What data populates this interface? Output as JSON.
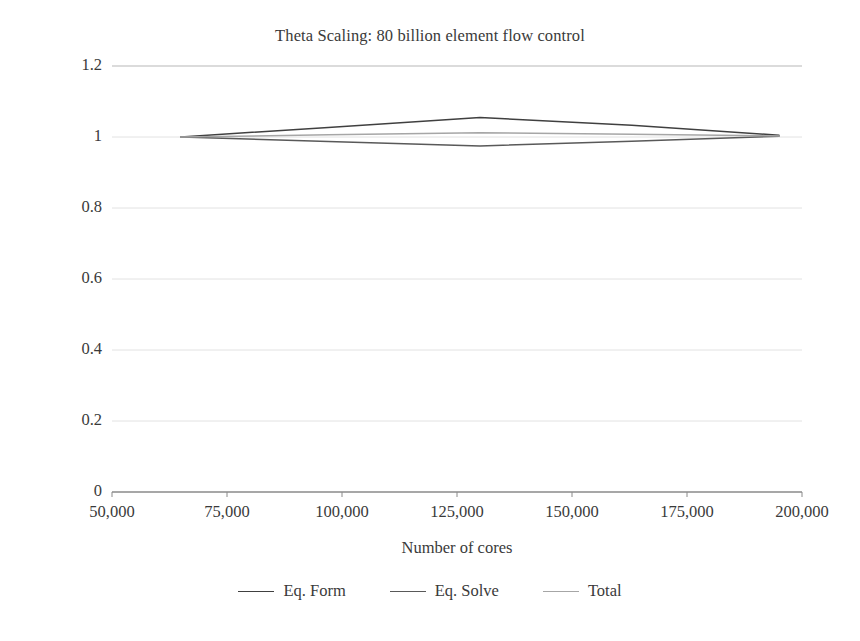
{
  "chart_data": {
    "type": "line",
    "title": "Theta Scaling: 80 billion element flow control",
    "xlabel": "Number of cores",
    "ylabel": "Scaling (core-hour ratio)",
    "xlim": [
      50000,
      200000
    ],
    "ylim": [
      0,
      1.2
    ],
    "xticks": [
      50000,
      75000,
      100000,
      125000,
      150000,
      175000,
      200000
    ],
    "xticklabels": [
      "50,000",
      "75,000",
      "100,000",
      "125,000",
      "150,000",
      "175,000",
      "200,000"
    ],
    "yticks": [
      0,
      0.2,
      0.4,
      0.6,
      0.8,
      1,
      1.2
    ],
    "yticklabels": [
      "0",
      "0.2",
      "0.4",
      "0.6",
      "0.8",
      "1",
      "1.2"
    ],
    "grid": "horizontal",
    "legend_position": "bottom",
    "x": [
      65000,
      97000,
      130000,
      163000,
      195000
    ],
    "series": [
      {
        "name": "Eq. Form",
        "color": "#404040",
        "values": [
          1.0,
          1.027,
          1.055,
          1.033,
          1.005
        ]
      },
      {
        "name": "Eq. Solve",
        "color": "#595959",
        "values": [
          1.0,
          0.987,
          0.975,
          0.988,
          1.002
        ]
      },
      {
        "name": "Total",
        "color": "#a6a6a6",
        "values": [
          1.0,
          1.006,
          1.012,
          1.008,
          1.003
        ]
      }
    ]
  },
  "legend": {
    "items": [
      {
        "label": "Eq. Form"
      },
      {
        "label": "Eq. Solve"
      },
      {
        "label": "Total"
      }
    ]
  }
}
